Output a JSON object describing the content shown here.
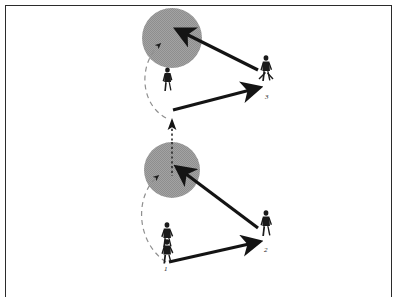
{
  "document": {
    "kind": "tactical-drill-diagram",
    "frame_color": "#2b2b2b",
    "background_color": "#ffffff"
  },
  "legend": {
    "zone_fill_color": "#9a9a9a",
    "arrow_color": "#141414",
    "player_color": "#1a1a1a",
    "dashed_color": "#8c8c8c"
  },
  "players": [
    {
      "id": "player-1",
      "label": "1",
      "label_x": 164,
      "label_y": 268,
      "figure_x": 166,
      "figure_y": 237,
      "description": "two overlapping figures at start position, bottom left"
    },
    {
      "id": "player-2",
      "label": "2",
      "label_x": 264,
      "label_y": 250,
      "figure_x": 266,
      "figure_y": 222,
      "description": "receiver, bottom right"
    },
    {
      "id": "player-3",
      "label": "3",
      "label_x": 265,
      "label_y": 97,
      "figure_x": 266,
      "figure_y": 68,
      "description": "receiver, upper right"
    },
    {
      "id": "player-upper-runner",
      "label": "",
      "figure_x": 167,
      "figure_y": 78,
      "description": "runner below upper zone"
    }
  ],
  "zones": [
    {
      "id": "zone-upper",
      "cx": 172,
      "cy": 38,
      "r": 30,
      "fill": "#9a9a9a"
    },
    {
      "id": "zone-lower",
      "cx": 172,
      "cy": 170,
      "r": 28,
      "fill": "#9a9a9a"
    }
  ],
  "arrows": [
    {
      "id": "pass-3-to-upper-zone",
      "from": "player-3",
      "to": "zone-upper",
      "style": "solid-thick"
    },
    {
      "id": "pass-to-player-3",
      "from": "lower-left-origin",
      "to": "player-3",
      "style": "solid-thick"
    },
    {
      "id": "pass-2-to-lower-zone",
      "from": "player-2",
      "to": "zone-lower",
      "style": "solid-thick"
    },
    {
      "id": "pass-1-to-player-2",
      "from": "player-1",
      "to": "player-2",
      "style": "solid-thick"
    },
    {
      "id": "run-upper-curve",
      "style": "dashed-curve",
      "to": "zone-upper"
    },
    {
      "id": "run-lower-curve",
      "style": "dashed-curve",
      "to": "zone-lower"
    },
    {
      "id": "run-vertical-dotted",
      "style": "dotted-vertical",
      "direction": "up"
    }
  ]
}
